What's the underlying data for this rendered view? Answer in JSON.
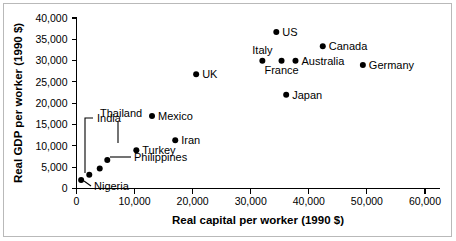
{
  "chart_data": {
    "type": "scatter",
    "title": "",
    "xlabel": "Real capital per worker (1990 $)",
    "ylabel": "Real GDP per worker (1990 $)",
    "xlim": [
      0,
      60000
    ],
    "ylim": [
      0,
      40000
    ],
    "xticks": [
      0,
      10000,
      20000,
      30000,
      40000,
      50000,
      60000
    ],
    "yticks": [
      0,
      5000,
      10000,
      15000,
      20000,
      25000,
      30000,
      35000,
      40000
    ],
    "xtick_labels": [
      "0",
      "10,000",
      "20,000",
      "30,000",
      "40,000",
      "50,000",
      "60,000"
    ],
    "ytick_labels": [
      "0",
      "5,000",
      "10,000",
      "15,000",
      "20,000",
      "25,000",
      "30,000",
      "35,000",
      "40,000"
    ],
    "grid": false,
    "legend": false,
    "marker_color": "#000000",
    "points": [
      {
        "name": "US",
        "x": 34400,
        "y": 36700,
        "label": "US",
        "label_pos": "right",
        "leader": false
      },
      {
        "name": "Canada",
        "x": 42400,
        "y": 33400,
        "label": "Canada",
        "label_pos": "right",
        "leader": false
      },
      {
        "name": "Italy",
        "x": 32000,
        "y": 30000,
        "label": "Italy",
        "label_pos": "above",
        "leader": false
      },
      {
        "name": "France",
        "x": 35300,
        "y": 30000,
        "label": "France",
        "label_pos": "below",
        "leader": false
      },
      {
        "name": "Australia",
        "x": 37700,
        "y": 30000,
        "label": "Australia",
        "label_pos": "right",
        "leader": false
      },
      {
        "name": "Germany",
        "x": 49300,
        "y": 29000,
        "label": "Germany",
        "label_pos": "right",
        "leader": false
      },
      {
        "name": "UK",
        "x": 20600,
        "y": 26800,
        "label": "UK",
        "label_pos": "right",
        "leader": false
      },
      {
        "name": "Japan",
        "x": 36100,
        "y": 22000,
        "label": "Japan",
        "label_pos": "right",
        "leader": false
      },
      {
        "name": "Mexico",
        "x": 13000,
        "y": 17000,
        "label": "Mexico",
        "label_pos": "right",
        "leader": false
      },
      {
        "name": "Iran",
        "x": 17000,
        "y": 11300,
        "label": "Iran",
        "label_pos": "right",
        "leader": false
      },
      {
        "name": "Turkey",
        "x": 10300,
        "y": 9000,
        "label": "Turkey",
        "label_pos": "right",
        "leader": false
      },
      {
        "name": "Thailand",
        "x": 5300,
        "y": 6700,
        "label": "Thailand",
        "label_pos": "leader",
        "leader": true
      },
      {
        "name": "Philippines",
        "x": 4000,
        "y": 4700,
        "label": "Philippines",
        "label_pos": "leader",
        "leader": true
      },
      {
        "name": "India",
        "x": 2200,
        "y": 3200,
        "label": "India",
        "label_pos": "leader",
        "leader": true
      },
      {
        "name": "Nigeria",
        "x": 800,
        "y": 2000,
        "label": "Nigeria",
        "label_pos": "leader",
        "leader": true
      }
    ]
  }
}
